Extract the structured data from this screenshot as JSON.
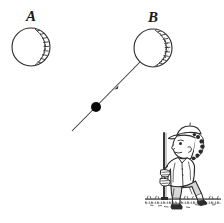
{
  "figure": {
    "background_color": "#ffffff",
    "ink_color": "#2b2b2b",
    "width": 224,
    "height": 223
  },
  "labels": {
    "ball_a": "A",
    "ball_b": "B"
  },
  "balls": [
    {
      "id": "ball-a",
      "label": "A",
      "center_x": 31,
      "center_y": 47,
      "radius": 19,
      "shading": "stippled-right-crescent",
      "outline_color": "#2b2b2b",
      "fill_color": "#ffffff"
    },
    {
      "id": "ball-b",
      "label": "B",
      "center_x": 153,
      "center_y": 48,
      "radius": 19,
      "shading": "stippled-right-crescent",
      "outline_color": "#2b2b2b",
      "fill_color": "#ffffff"
    }
  ],
  "trajectory": {
    "name": "trajectory-line",
    "start_x": 72,
    "start_y": 131,
    "end_x": 140,
    "end_y": 62,
    "stroke_color": "#3a3a3a",
    "arrow_marker_at": {
      "x": 116,
      "y": 87
    },
    "point_marker": {
      "name": "trajectory-point",
      "x": 96,
      "y": 107,
      "radius": 5,
      "fill_color": "#0a0a0a"
    }
  },
  "golfer": {
    "name": "golfer-figure",
    "ink_color": "#2b2b2b",
    "cap": "golf-cap",
    "club": {
      "name": "golf-club",
      "shaft_top_x": 164,
      "shaft_top_y": 133,
      "shaft_bottom_x": 164,
      "shaft_bottom_y": 200
    },
    "ground": {
      "name": "ground-line",
      "left_x": 145,
      "right_x": 221,
      "y": 199
    }
  }
}
